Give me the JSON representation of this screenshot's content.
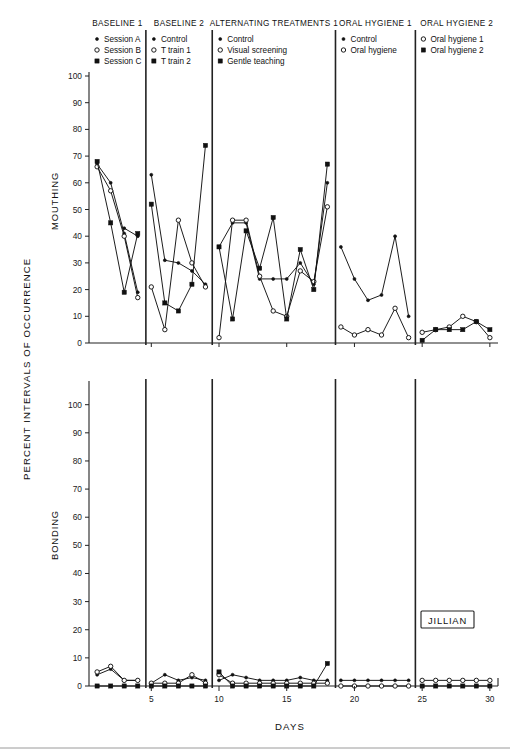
{
  "figure": {
    "subject_label": "JILLIAN",
    "y_axis_title": "PERCENT INTERVALS OF OCCURRENCE",
    "x_axis_title": "DAYS",
    "x_tick_labels": [
      "5",
      "10",
      "15",
      "20",
      "25",
      "30"
    ],
    "x_ticks": [
      5,
      10,
      15,
      20,
      25,
      30
    ],
    "y_tick_labels": [
      "0",
      "10",
      "20",
      "30",
      "40",
      "50",
      "60",
      "70",
      "80",
      "90",
      "100"
    ],
    "y_ticks": [
      0,
      10,
      20,
      30,
      40,
      50,
      60,
      70,
      80,
      90,
      100
    ],
    "panels": [
      {
        "name": "MOUTHING",
        "title": "MOUTHING"
      },
      {
        "name": "BONDING",
        "title": "BONDING"
      }
    ],
    "phases": [
      {
        "id": "baseline1",
        "label": "BASELINE 1",
        "x_start": 0.4,
        "x_end": 4.6
      },
      {
        "id": "baseline2",
        "label": "BASELINE 2",
        "x_start": 4.6,
        "x_end": 9.5
      },
      {
        "id": "alternating",
        "label": "ALTERNATING TREATMENTS 1",
        "x_start": 9.5,
        "x_end": 18.6
      },
      {
        "id": "oral1",
        "label": "ORAL HYGIENE 1",
        "x_start": 18.6,
        "x_end": 24.5
      },
      {
        "id": "oral2",
        "label": "ORAL HYGIENE 2",
        "x_start": 24.5,
        "x_end": 30.6
      }
    ],
    "legends": [
      {
        "phase": "baseline1",
        "entries": [
          {
            "label": "Session A",
            "marker": "dot"
          },
          {
            "label": "Session B",
            "marker": "open"
          },
          {
            "label": "Session C",
            "marker": "square"
          }
        ]
      },
      {
        "phase": "baseline2",
        "entries": [
          {
            "label": "Control",
            "marker": "dot"
          },
          {
            "label": "T train 1",
            "marker": "open"
          },
          {
            "label": "T train 2",
            "marker": "square"
          }
        ]
      },
      {
        "phase": "alternating",
        "entries": [
          {
            "label": "Control",
            "marker": "dot"
          },
          {
            "label": "Visual screening",
            "marker": "open"
          },
          {
            "label": "Gentle teaching",
            "marker": "square"
          }
        ]
      },
      {
        "phase": "oral1",
        "entries": [
          {
            "label": "Control",
            "marker": "dot"
          },
          {
            "label": "Oral hygiene",
            "marker": "open"
          }
        ]
      },
      {
        "phase": "oral2",
        "entries": [
          {
            "label": "Oral hygiene 1",
            "marker": "open"
          },
          {
            "label": "Oral hygiene 2",
            "marker": "square"
          }
        ]
      }
    ]
  },
  "chart_data": [
    {
      "type": "line",
      "title": "MOUTHING",
      "panel": "top",
      "xlabel": "DAYS",
      "ylabel": "PERCENT INTERVALS OF OCCURRENCE",
      "xlim": [
        0.4,
        30.6
      ],
      "ylim": [
        -3,
        103
      ],
      "grid": false,
      "legend_position": "above-panels",
      "series": [
        {
          "name": "Session A",
          "phase": "baseline1",
          "marker": "dot",
          "x": [
            1,
            2,
            3,
            4
          ],
          "y": [
            67,
            60,
            41,
            19
          ]
        },
        {
          "name": "Session B",
          "phase": "baseline1",
          "marker": "open",
          "x": [
            1,
            2,
            3,
            4
          ],
          "y": [
            66,
            57,
            40,
            17
          ]
        },
        {
          "name": "Session C",
          "phase": "baseline1",
          "marker": "square",
          "x": [
            1,
            2,
            3,
            4
          ],
          "y": [
            68,
            45,
            19,
            41
          ]
        },
        {
          "name": "Session A extra",
          "phase": "baseline1",
          "marker": "dot",
          "x": [
            3,
            4
          ],
          "y": [
            43,
            40
          ]
        },
        {
          "name": "Control",
          "phase": "baseline2",
          "marker": "dot",
          "x": [
            5,
            6,
            7,
            8,
            9
          ],
          "y": [
            63,
            31,
            30,
            27,
            22
          ]
        },
        {
          "name": "T train 1",
          "phase": "baseline2",
          "marker": "open",
          "x": [
            5,
            6,
            7,
            8,
            9
          ],
          "y": [
            21,
            5,
            46,
            30,
            21
          ]
        },
        {
          "name": "T train 2",
          "phase": "baseline2",
          "marker": "square",
          "x": [
            5,
            6,
            7,
            8,
            9
          ],
          "y": [
            52,
            15,
            12,
            22,
            74
          ]
        },
        {
          "name": "Control",
          "phase": "alternating",
          "marker": "dot",
          "x": [
            10,
            11,
            12,
            13,
            14,
            15,
            16,
            17,
            18
          ],
          "y": [
            36,
            45,
            45,
            24,
            24,
            24,
            30,
            22,
            60
          ]
        },
        {
          "name": "Visual screening",
          "phase": "alternating",
          "marker": "open",
          "x": [
            10,
            11,
            12,
            13,
            14,
            15,
            16,
            17,
            18
          ],
          "y": [
            2,
            46,
            46,
            25,
            12,
            10,
            27,
            23,
            51
          ]
        },
        {
          "name": "Gentle teaching",
          "phase": "alternating",
          "marker": "square",
          "x": [
            10,
            11,
            12,
            13,
            14,
            15,
            16,
            17,
            18
          ],
          "y": [
            36,
            9,
            42,
            28,
            47,
            9,
            35,
            20,
            67
          ]
        },
        {
          "name": "Control",
          "phase": "oral1",
          "marker": "dot",
          "x": [
            19,
            20,
            21,
            22,
            23,
            24
          ],
          "y": [
            36,
            24,
            16,
            18,
            40,
            10
          ]
        },
        {
          "name": "Oral hygiene",
          "phase": "oral1",
          "marker": "open",
          "x": [
            19,
            20,
            21,
            22,
            23,
            24
          ],
          "y": [
            6,
            3,
            5,
            3,
            13,
            2
          ]
        },
        {
          "name": "Oral hygiene 1",
          "phase": "oral2",
          "marker": "open",
          "x": [
            25,
            26,
            27,
            28,
            29,
            30
          ],
          "y": [
            4,
            5,
            6,
            10,
            8,
            2
          ]
        },
        {
          "name": "Oral hygiene 2",
          "phase": "oral2",
          "marker": "square",
          "x": [
            25,
            26,
            27,
            28,
            29,
            30
          ],
          "y": [
            1,
            5,
            5,
            5,
            8,
            5
          ]
        }
      ]
    },
    {
      "type": "line",
      "title": "BONDING",
      "panel": "bottom",
      "xlabel": "DAYS",
      "ylabel": "PERCENT INTERVALS OF OCCURRENCE",
      "xlim": [
        0.4,
        30.6
      ],
      "ylim": [
        -3,
        107
      ],
      "grid": false,
      "legend_position": "none",
      "series": [
        {
          "name": "Session A",
          "phase": "baseline1",
          "marker": "dot",
          "x": [
            1,
            2,
            3,
            4
          ],
          "y": [
            4,
            6,
            2,
            2
          ]
        },
        {
          "name": "Session B",
          "phase": "baseline1",
          "marker": "open",
          "x": [
            1,
            2,
            3,
            4
          ],
          "y": [
            5,
            7,
            2,
            2
          ]
        },
        {
          "name": "Session C",
          "phase": "baseline1",
          "marker": "square",
          "x": [
            1,
            2,
            3,
            4
          ],
          "y": [
            0,
            0,
            0,
            0
          ]
        },
        {
          "name": "Control",
          "phase": "baseline2",
          "marker": "dot",
          "x": [
            5,
            6,
            7,
            8,
            9
          ],
          "y": [
            1,
            4,
            2,
            3,
            2
          ]
        },
        {
          "name": "T train 1",
          "phase": "baseline2",
          "marker": "open",
          "x": [
            5,
            6,
            7,
            8,
            9
          ],
          "y": [
            1,
            1,
            1,
            4,
            1
          ]
        },
        {
          "name": "T train 2",
          "phase": "baseline2",
          "marker": "square",
          "x": [
            5,
            6,
            7,
            8,
            9
          ],
          "y": [
            0,
            0,
            0,
            0,
            0
          ]
        },
        {
          "name": "Control",
          "phase": "alternating",
          "marker": "dot",
          "x": [
            10,
            11,
            12,
            13,
            14,
            15,
            16,
            17,
            18
          ],
          "y": [
            2,
            4,
            3,
            2,
            2,
            2,
            3,
            2,
            2
          ]
        },
        {
          "name": "Visual screening",
          "phase": "alternating",
          "marker": "open",
          "x": [
            10,
            11,
            12,
            13,
            14,
            15,
            16,
            17,
            18
          ],
          "y": [
            4,
            1,
            1,
            1,
            1,
            1,
            1,
            1,
            1
          ]
        },
        {
          "name": "Gentle teaching",
          "phase": "alternating",
          "marker": "square",
          "x": [
            10,
            11,
            12,
            13,
            14,
            15,
            16,
            17,
            18
          ],
          "y": [
            5,
            0,
            0,
            0,
            0,
            0,
            0,
            0,
            8
          ]
        },
        {
          "name": "Control",
          "phase": "oral1",
          "marker": "dot",
          "x": [
            19,
            20,
            21,
            22,
            23,
            24
          ],
          "y": [
            2,
            2,
            2,
            2,
            2,
            2
          ]
        },
        {
          "name": "Oral hygiene",
          "phase": "oral1",
          "marker": "open",
          "x": [
            19,
            20,
            21,
            22,
            23,
            24
          ],
          "y": [
            0,
            0,
            0,
            0,
            0,
            0
          ]
        },
        {
          "name": "Oral hygiene 1",
          "phase": "oral2",
          "marker": "open",
          "x": [
            25,
            26,
            27,
            28,
            29,
            30
          ],
          "y": [
            2,
            2,
            2,
            2,
            2,
            2
          ]
        },
        {
          "name": "Oral hygiene 2",
          "phase": "oral2",
          "marker": "square",
          "x": [
            25,
            26,
            27,
            28,
            29,
            30
          ],
          "y": [
            0,
            0,
            0,
            0,
            0,
            0
          ]
        }
      ]
    }
  ]
}
